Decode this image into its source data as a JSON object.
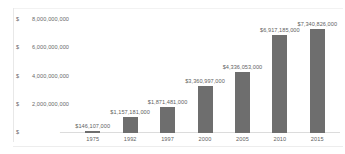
{
  "chart_data": {
    "type": "bar",
    "title": "",
    "xlabel": "",
    "ylabel": "",
    "categories": [
      "1975",
      "1992",
      "1997",
      "2000",
      "2005",
      "2010",
      "2015"
    ],
    "values": [
      146107000,
      1157181000,
      1871481000,
      3360997000,
      4336053000,
      6917185000,
      7340826000
    ],
    "data_labels": [
      "$146,107,000",
      "$1,157,181,000",
      "$1,871,481,000",
      "$3,360,997,000",
      "$4,336,053,000",
      "$6,917,185,000",
      "$7,340,826,000"
    ],
    "ylim": [
      0,
      8000000000
    ],
    "grid": false,
    "legend": false,
    "bar_color": "#6e6e6e",
    "y_ticks": [
      {
        "currency": "$",
        "label": "8,000,000,000",
        "value": 8000000000
      },
      {
        "currency": "$",
        "label": "6,000,000,000",
        "value": 6000000000
      },
      {
        "currency": "$",
        "label": "4,000,000,000",
        "value": 4000000000
      },
      {
        "currency": "$",
        "label": "2,000,000,000",
        "value": 2000000000
      },
      {
        "currency": "$",
        "label": "-",
        "value": 0
      }
    ]
  }
}
